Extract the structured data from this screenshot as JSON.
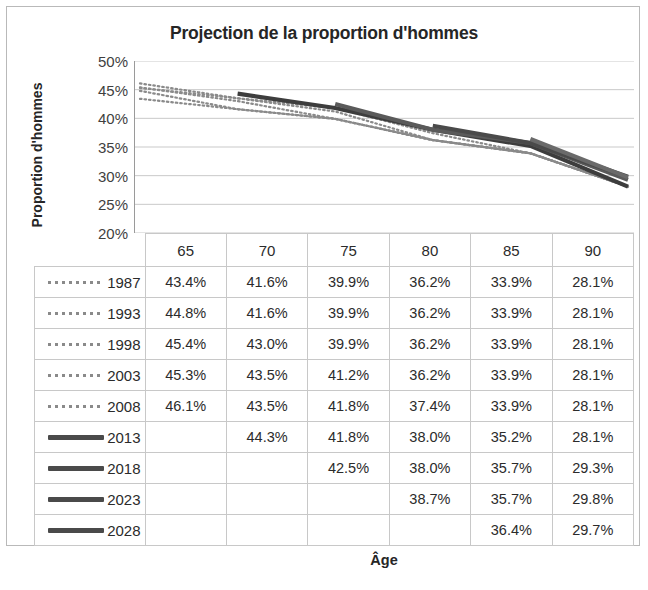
{
  "chart_data": {
    "type": "line",
    "title": "Projection de la proportion d'hommes",
    "xlabel": "Âge",
    "ylabel": "Proportion d'hommes",
    "grid": true,
    "legend_position": "table-left",
    "x": [
      65,
      70,
      75,
      80,
      85,
      90
    ],
    "categories": [
      "65",
      "70",
      "75",
      "80",
      "85",
      "90"
    ],
    "ylim": [
      20,
      50
    ],
    "ytick_labels": [
      "50%",
      "45%",
      "40%",
      "35%",
      "30%",
      "25%",
      "20%"
    ],
    "ytick_values": [
      50,
      45,
      40,
      35,
      30,
      25,
      20
    ],
    "series": [
      {
        "name": "1987",
        "style": "dotted",
        "color": "#8a8a8a",
        "labels": [
          "43.4%",
          "41.6%",
          "39.9%",
          "36.2%",
          "33.9%",
          "28.1%"
        ],
        "values": [
          43.4,
          41.6,
          39.9,
          36.2,
          33.9,
          28.1
        ]
      },
      {
        "name": "1993",
        "style": "dotted",
        "color": "#8a8a8a",
        "labels": [
          "44.8%",
          "41.6%",
          "39.9%",
          "36.2%",
          "33.9%",
          "28.1%"
        ],
        "values": [
          44.8,
          41.6,
          39.9,
          36.2,
          33.9,
          28.1
        ]
      },
      {
        "name": "1998",
        "style": "dotted",
        "color": "#8a8a8a",
        "labels": [
          "45.4%",
          "43.0%",
          "39.9%",
          "36.2%",
          "33.9%",
          "28.1%"
        ],
        "values": [
          45.4,
          43.0,
          39.9,
          36.2,
          33.9,
          28.1
        ]
      },
      {
        "name": "2003",
        "style": "dotted",
        "color": "#8a8a8a",
        "labels": [
          "45.3%",
          "43.5%",
          "41.2%",
          "36.2%",
          "33.9%",
          "28.1%"
        ],
        "values": [
          45.3,
          43.5,
          41.2,
          36.2,
          33.9,
          28.1
        ]
      },
      {
        "name": "2008",
        "style": "dotted",
        "color": "#8a8a8a",
        "labels": [
          "46.1%",
          "43.5%",
          "41.8%",
          "37.4%",
          "33.9%",
          "28.1%"
        ],
        "values": [
          46.1,
          43.5,
          41.8,
          37.4,
          33.9,
          28.1
        ]
      },
      {
        "name": "2013",
        "style": "solid",
        "color": "#3d3d3d",
        "labels": [
          "",
          "44.3%",
          "41.8%",
          "38.0%",
          "35.2%",
          "28.1%"
        ],
        "values": [
          null,
          44.3,
          41.8,
          38.0,
          35.2,
          28.1
        ]
      },
      {
        "name": "2018",
        "style": "solid",
        "color": "#5a5a5a",
        "labels": [
          "",
          "",
          "42.5%",
          "38.0%",
          "35.7%",
          "29.3%"
        ],
        "values": [
          null,
          null,
          42.5,
          38.0,
          35.7,
          29.3
        ]
      },
      {
        "name": "2023",
        "style": "solid",
        "color": "#4a4a4a",
        "labels": [
          "",
          "",
          "",
          "38.7%",
          "35.7%",
          "29.8%"
        ],
        "values": [
          null,
          null,
          null,
          38.7,
          35.7,
          29.8
        ]
      },
      {
        "name": "2028",
        "style": "solid",
        "color": "#6a6a6a",
        "labels": [
          "",
          "",
          "",
          "",
          "36.4%",
          "29.7%"
        ],
        "values": [
          null,
          null,
          null,
          null,
          36.4,
          29.7
        ]
      }
    ]
  },
  "table": {
    "header_row": [
      "65",
      "70",
      "75",
      "80",
      "85",
      "90"
    ],
    "rows": [
      {
        "year": "1987",
        "marker": "dotted",
        "cells": [
          "43.4%",
          "41.6%",
          "39.9%",
          "36.2%",
          "33.9%",
          "28.1%"
        ]
      },
      {
        "year": "1993",
        "marker": "dotted",
        "cells": [
          "44.8%",
          "41.6%",
          "39.9%",
          "36.2%",
          "33.9%",
          "28.1%"
        ]
      },
      {
        "year": "1998",
        "marker": "dotted",
        "cells": [
          "45.4%",
          "43.0%",
          "39.9%",
          "36.2%",
          "33.9%",
          "28.1%"
        ]
      },
      {
        "year": "2003",
        "marker": "dotted",
        "cells": [
          "45.3%",
          "43.5%",
          "41.2%",
          "36.2%",
          "33.9%",
          "28.1%"
        ]
      },
      {
        "year": "2008",
        "marker": "dotted",
        "cells": [
          "46.1%",
          "43.5%",
          "41.8%",
          "37.4%",
          "33.9%",
          "28.1%"
        ]
      },
      {
        "year": "2013",
        "marker": "solid",
        "cells": [
          "",
          "44.3%",
          "41.8%",
          "38.0%",
          "35.2%",
          "28.1%"
        ]
      },
      {
        "year": "2018",
        "marker": "solid",
        "cells": [
          "",
          "",
          "42.5%",
          "38.0%",
          "35.7%",
          "29.3%"
        ]
      },
      {
        "year": "2023",
        "marker": "solid",
        "cells": [
          "",
          "",
          "",
          "38.7%",
          "35.7%",
          "29.8%"
        ]
      },
      {
        "year": "2028",
        "marker": "solid",
        "cells": [
          "",
          "",
          "",
          "",
          "36.4%",
          "29.7%"
        ]
      }
    ]
  },
  "colors": {
    "frame": "#b9b9b9",
    "grid": "#c9c9c9",
    "text": "#262626",
    "dotted_series": "#8a8a8a",
    "solid_series": "#404040"
  }
}
